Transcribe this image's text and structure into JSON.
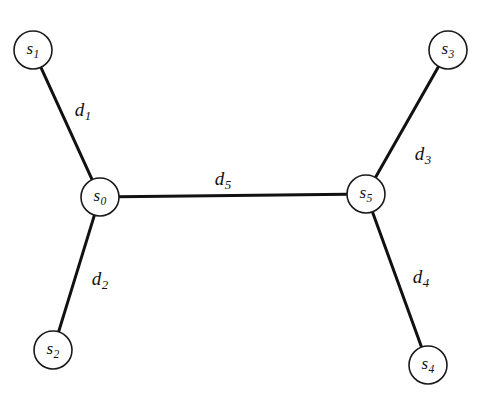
{
  "diagram": {
    "background_color": "#ffffff",
    "line_color": "#111111",
    "node_fill": "#ffffff",
    "node_stroke": "#1a1a1a",
    "width": 478,
    "height": 396,
    "nodes": [
      {
        "id": "s0",
        "base": "s",
        "sub": "0",
        "label": "s0",
        "cx": 100,
        "cy": 197,
        "r": 19
      },
      {
        "id": "s1",
        "base": "s",
        "sub": "1",
        "label": "s1",
        "cx": 33,
        "cy": 50,
        "r": 19
      },
      {
        "id": "s2",
        "base": "s",
        "sub": "2",
        "label": "s2",
        "cx": 53,
        "cy": 350,
        "r": 19
      },
      {
        "id": "s3",
        "base": "s",
        "sub": "3",
        "label": "s3",
        "cx": 448,
        "cy": 50,
        "r": 19
      },
      {
        "id": "s4",
        "base": "s",
        "sub": "4",
        "label": "s4",
        "cx": 428,
        "cy": 365,
        "r": 19
      },
      {
        "id": "s5",
        "base": "s",
        "sub": "5",
        "label": "s5",
        "cx": 366,
        "cy": 194,
        "r": 19
      }
    ],
    "edges": [
      {
        "id": "d1",
        "base": "d",
        "sub": "1",
        "label": "d1",
        "from": "s1",
        "to": "s0",
        "lx": 83,
        "ly": 112
      },
      {
        "id": "d2",
        "base": "d",
        "sub": "2",
        "label": "d2",
        "from": "s0",
        "to": "s2",
        "lx": 100,
        "ly": 281
      },
      {
        "id": "d3",
        "base": "d",
        "sub": "3",
        "label": "d3",
        "from": "s5",
        "to": "s3",
        "lx": 423,
        "ly": 156
      },
      {
        "id": "d4",
        "base": "d",
        "sub": "4",
        "label": "d4",
        "from": "s5",
        "to": "s4",
        "lx": 421,
        "ly": 279
      },
      {
        "id": "d5",
        "base": "d",
        "sub": "5",
        "label": "d5",
        "from": "s0",
        "to": "s5",
        "lx": 223,
        "ly": 181
      }
    ]
  }
}
